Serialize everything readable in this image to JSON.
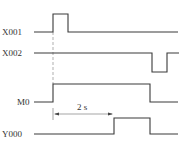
{
  "diagram": {
    "type": "timing",
    "signals": [
      {
        "name": "X001",
        "label_y": 35,
        "baseline_y": 32,
        "high_y": 14,
        "path": "M34,32 L53,32 L53,14 L68,14 L68,32 L178,32"
      },
      {
        "name": "X002",
        "label_y": 55,
        "baseline_y": 53,
        "low_y": 72,
        "path": "M34,53 L152,53 L152,72 L167,72 L167,53 L179,53"
      },
      {
        "name": "M0",
        "label_y": 105,
        "baseline_y": 102,
        "high_y": 84,
        "path": "M34,102 L53,102 L53,84 L150,84 L150,102 L178,102"
      },
      {
        "name": "Y000",
        "label_y": 137,
        "baseline_y": 134,
        "high_y": 118,
        "path": "M34,134 L114,134 L114,118 L150,118 L150,134 L178,134"
      }
    ],
    "dimension": {
      "label": "2 s",
      "x1": 53,
      "x2": 114,
      "y": 114
    },
    "reference_line": {
      "x": 53,
      "y1": 14,
      "y2": 84
    }
  }
}
